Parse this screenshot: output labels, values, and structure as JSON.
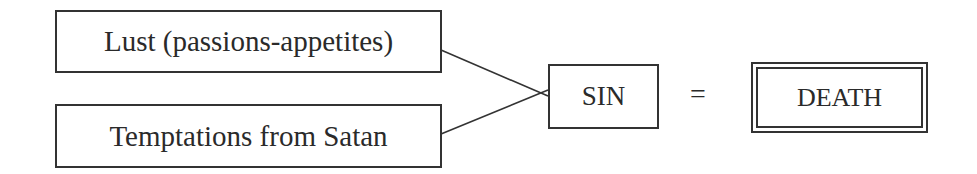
{
  "diagram": {
    "inputs": [
      {
        "label": "Lust (passions-appetites)"
      },
      {
        "label": "Temptations from Satan"
      }
    ],
    "middle": {
      "label": "SIN"
    },
    "operator": "=",
    "result": {
      "label": "DEATH"
    }
  }
}
